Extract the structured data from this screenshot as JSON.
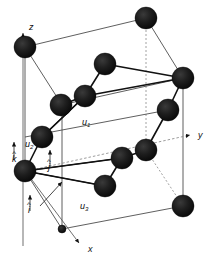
{
  "figure": {
    "kind": "crystal-lattice-unit-cell",
    "background_color": "#ffffff",
    "atom_color": "#161616",
    "line_color": "#4d4d4d",
    "bond_color": "#111111",
    "dashed_color": "#8a8a8a",
    "atom_radius": 11,
    "small_atom_radius": 4
  },
  "axes": [
    {
      "name": "z-axis",
      "label": "z",
      "label_x": 29,
      "label_y": 23,
      "tail_x": 23,
      "tail_y": 246,
      "head_x": 23,
      "head_y": 33
    },
    {
      "name": "y-axis",
      "label": "y",
      "label_x": 198,
      "label_y": 131,
      "tail_x": 27,
      "tail_y": 171,
      "head_x": 190,
      "head_y": 135
    },
    {
      "name": "x-axis",
      "label": "x",
      "label_x": 88,
      "label_y": 245,
      "tail_x": 26,
      "tail_y": 172,
      "head_x": 79,
      "head_y": 243
    }
  ],
  "unit_vectors": [
    {
      "name": "i-hat",
      "symbol": "i",
      "hat": "^",
      "label_x": 28,
      "label_y": 206,
      "tail_x": 30,
      "tail_y": 211,
      "head_x": 30,
      "head_y": 195
    },
    {
      "name": "j-hat",
      "symbol": "j",
      "hat": "^",
      "label_x": 48,
      "label_y": 163,
      "tail_x": 50,
      "tail_y": 168,
      "head_x": 50,
      "head_y": 150
    },
    {
      "name": "k-hat",
      "symbol": "k",
      "hat": "^",
      "label_x": 12,
      "label_y": 155,
      "tail_x": 14,
      "tail_y": 160,
      "head_x": 14,
      "head_y": 142
    }
  ],
  "displacement_labels": [
    {
      "name": "u1-label",
      "symbol": "u",
      "subscript": "1",
      "x": 82,
      "y": 118
    },
    {
      "name": "u2-label",
      "symbol": "u",
      "subscript": "2",
      "x": 25,
      "y": 140
    },
    {
      "name": "u3-label",
      "symbol": "u",
      "subscript": "3",
      "x": 80,
      "y": 202
    }
  ],
  "atoms": [
    {
      "name": "atom-top-left-back",
      "cx": 25,
      "cy": 47,
      "r": 11
    },
    {
      "name": "atom-top-right-back",
      "cx": 146,
      "cy": 18,
      "r": 11
    },
    {
      "name": "atom-upper-mid",
      "cx": 105,
      "cy": 64,
      "r": 11
    },
    {
      "name": "atom-right-upper",
      "cx": 183,
      "cy": 78,
      "r": 11
    },
    {
      "name": "atom-mid-left-a",
      "cx": 61,
      "cy": 105,
      "r": 11
    },
    {
      "name": "atom-mid-center-a",
      "cx": 85,
      "cy": 96,
      "r": 11
    },
    {
      "name": "atom-right-mid",
      "cx": 168,
      "cy": 110,
      "r": 11
    },
    {
      "name": "atom-left-mid",
      "cx": 42,
      "cy": 137,
      "r": 11
    },
    {
      "name": "atom-left-front",
      "cx": 25,
      "cy": 171,
      "r": 11
    },
    {
      "name": "atom-center-low",
      "cx": 122,
      "cy": 158,
      "r": 11
    },
    {
      "name": "atom-center-low-b",
      "cx": 146,
      "cy": 150,
      "r": 11
    },
    {
      "name": "atom-bottom-mid",
      "cx": 105,
      "cy": 186,
      "r": 11
    },
    {
      "name": "atom-bottom-right",
      "cx": 183,
      "cy": 206,
      "r": 11
    },
    {
      "name": "atom-bottom-origin",
      "cx": 62,
      "cy": 229,
      "r": 4
    }
  ],
  "cell_edges": [
    {
      "name": "edge-top-back",
      "x1": 25,
      "y1": 47,
      "x2": 146,
      "y2": 18,
      "style": "solid"
    },
    {
      "name": "edge-top-right",
      "x1": 146,
      "y1": 18,
      "x2": 183,
      "y2": 78,
      "style": "solid"
    },
    {
      "name": "edge-left-vertical",
      "x1": 25,
      "y1": 47,
      "x2": 25,
      "y2": 171,
      "style": "solid"
    },
    {
      "name": "edge-right-vertical",
      "x1": 183,
      "y1": 78,
      "x2": 183,
      "y2": 206,
      "style": "solid"
    },
    {
      "name": "edge-front-vertical",
      "x1": 62,
      "y1": 105,
      "x2": 62,
      "y2": 229,
      "style": "solid"
    },
    {
      "name": "edge-hidden-vertical",
      "x1": 146,
      "y1": 18,
      "x2": 146,
      "y2": 150,
      "style": "dashed"
    },
    {
      "name": "edge-bottom-left",
      "x1": 25,
      "y1": 171,
      "x2": 62,
      "y2": 229,
      "style": "solid"
    },
    {
      "name": "edge-bottom-front",
      "x1": 62,
      "y1": 229,
      "x2": 183,
      "y2": 206,
      "style": "solid"
    },
    {
      "name": "edge-bottom-hidden",
      "x1": 146,
      "y1": 150,
      "x2": 183,
      "y2": 206,
      "style": "dashed"
    },
    {
      "name": "edge-left-diag",
      "x1": 25,
      "y1": 47,
      "x2": 62,
      "y2": 105,
      "style": "solid"
    },
    {
      "name": "edge-mid-horizontal",
      "x1": 25,
      "y1": 137,
      "x2": 168,
      "y2": 110,
      "style": "solid"
    },
    {
      "name": "edge-mid-back",
      "x1": 61,
      "y1": 105,
      "x2": 183,
      "y2": 78,
      "style": "solid"
    }
  ],
  "bonds": [
    {
      "name": "bond-1",
      "x1": 85,
      "y1": 96,
      "x2": 105,
      "y2": 64
    },
    {
      "name": "bond-2",
      "x1": 105,
      "y1": 64,
      "x2": 183,
      "y2": 78
    },
    {
      "name": "bond-3",
      "x1": 85,
      "y1": 96,
      "x2": 61,
      "y2": 105
    },
    {
      "name": "bond-4",
      "x1": 85,
      "y1": 96,
      "x2": 183,
      "y2": 78
    },
    {
      "name": "bond-5",
      "x1": 42,
      "y1": 137,
      "x2": 85,
      "y2": 96
    },
    {
      "name": "bond-6",
      "x1": 42,
      "y1": 137,
      "x2": 25,
      "y2": 171
    },
    {
      "name": "bond-7",
      "x1": 25,
      "y1": 171,
      "x2": 122,
      "y2": 158
    },
    {
      "name": "bond-8",
      "x1": 122,
      "y1": 158,
      "x2": 146,
      "y2": 150
    },
    {
      "name": "bond-9",
      "x1": 122,
      "y1": 158,
      "x2": 105,
      "y2": 186
    },
    {
      "name": "bond-10",
      "x1": 146,
      "y1": 150,
      "x2": 168,
      "y2": 110
    },
    {
      "name": "bond-11",
      "x1": 168,
      "y1": 110,
      "x2": 183,
      "y2": 78
    },
    {
      "name": "bond-12",
      "x1": 25,
      "y1": 171,
      "x2": 105,
      "y2": 186
    }
  ]
}
